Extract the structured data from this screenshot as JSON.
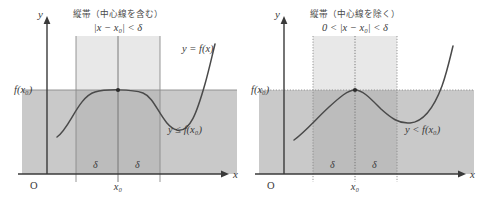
{
  "figure": {
    "colors": {
      "background": "#ffffff",
      "axis": "#3a3a3a",
      "curve": "#4a4a4a",
      "region_fill": "#c9c9c9",
      "band_fill": "#e8e8e8",
      "band_overlap_fill": "#bcbcbc",
      "text": "#3a3a3a",
      "guide_line": "#6e6e6e"
    }
  },
  "panels": [
    {
      "id": "left",
      "heading_jp": "縦帯（中心線を含む）",
      "heading_math": "|x − x₀| < δ",
      "curve_label": "y = f(x)",
      "region_label": "y ≤ f(x₀)",
      "y_axis_label": "y",
      "x_axis_label": "x",
      "origin_label": "O",
      "value_label": "f(x₀)",
      "center_label": "x₀",
      "delta_left_label": "δ",
      "delta_right_label": "δ",
      "center_line_style": "solid",
      "band_edge_style": "solid",
      "level_line_style": "solid",
      "inequality": "non-strict",
      "dot_filled": true,
      "curve_shape": "plateau"
    },
    {
      "id": "right",
      "heading_jp": "縦帯（中心線を除く）",
      "heading_math": "0 < |x − x₀| < δ",
      "curve_label": "",
      "region_label": "y < f(x₀)",
      "y_axis_label": "y",
      "x_axis_label": "x",
      "origin_label": "O",
      "value_label": "f(x₀)",
      "center_label": "x₀",
      "delta_left_label": "δ",
      "delta_right_label": "δ",
      "center_line_style": "dotted",
      "band_edge_style": "dotted",
      "level_line_style": "dotted",
      "inequality": "strict",
      "dot_filled": true,
      "curve_shape": "peak"
    }
  ]
}
